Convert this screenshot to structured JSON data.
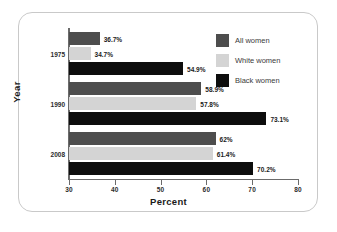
{
  "chart_data": {
    "type": "bar",
    "orientation": "horizontal",
    "title": "",
    "xlabel": "Percent",
    "ylabel": "Year",
    "xlim": [
      30,
      80
    ],
    "xticks": [
      30,
      40,
      50,
      60,
      70,
      80
    ],
    "grid": false,
    "legend_position": "top-right",
    "categories": [
      "1975",
      "1990",
      "2008"
    ],
    "series": [
      {
        "name": "All women",
        "color": "#4d4d4d",
        "values": [
          36.7,
          58.9,
          62
        ],
        "labels": [
          "36.7%",
          "58.9%",
          "62%"
        ]
      },
      {
        "name": "White women",
        "color": "#d4d4d4",
        "values": [
          34.7,
          57.8,
          61.4
        ],
        "labels": [
          "34.7%",
          "57.8%",
          "61.4%"
        ]
      },
      {
        "name": "Black women",
        "color": "#0d0d0d",
        "values": [
          54.9,
          73.1,
          70.2
        ],
        "labels": [
          "54.9%",
          "73.1%",
          "70.2%"
        ]
      }
    ]
  },
  "axis": {
    "x_title": "Percent",
    "y_title": "Year",
    "x_tick_labels": [
      "30",
      "40",
      "50",
      "60",
      "70",
      "80"
    ],
    "y_tick_labels": [
      "1975",
      "1990",
      "2008"
    ]
  },
  "legend": {
    "items": [
      {
        "label": "All women",
        "color": "#4d4d4d"
      },
      {
        "label": "White women",
        "color": "#d4d4d4"
      },
      {
        "label": "Black women",
        "color": "#0d0d0d"
      }
    ]
  }
}
